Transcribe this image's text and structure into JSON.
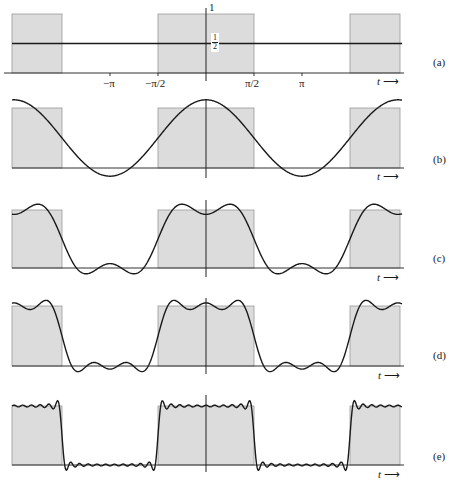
{
  "chart_data": {
    "type": "line",
    "title": "",
    "xlabel": "t",
    "ylabel": "",
    "x_ticks": [
      "−π",
      "−π/2",
      "π/2",
      "π"
    ],
    "x_tick_values": [
      -3.14159,
      -1.5708,
      1.5708,
      3.14159
    ],
    "y_ticks": [
      "1",
      "1/2"
    ],
    "y_tick_values": [
      1,
      0.5
    ],
    "xlim": [
      -5.1,
      5.1
    ],
    "square_wave": {
      "high": 1,
      "low": 0,
      "high_intervals": [
        [
          -5.1,
          -4.712
        ],
        [
          -1.5708,
          1.5708
        ],
        [
          4.712,
          5.1
        ]
      ]
    },
    "fill_color": "#dcdcdc",
    "line_color": "#1a1a1a",
    "panels": [
      {
        "label": "(a)",
        "terms": 0,
        "series": "1/2"
      },
      {
        "label": "(b)",
        "terms": 1,
        "series": "1/2 + (2/π)cos t"
      },
      {
        "label": "(c)",
        "terms": 2,
        "series": "1/2 + (2/π)(cos t − cos 3t/3)"
      },
      {
        "label": "(d)",
        "terms": 3,
        "series": "1/2 + (2/π)(cos t − cos 3t/3 + cos 5t/5)"
      },
      {
        "label": "(e)",
        "terms": 11,
        "series": "1/2 + (2/π)Σ(−1)^k cos((2k+1)t)/(2k+1), k=0..10"
      }
    ]
  },
  "axis": {
    "t_label": "t",
    "arrow": "⟶",
    "one_label": "1",
    "half_num": "1",
    "half_den": "2",
    "ticks": {
      "neg_pi": "−π",
      "neg_half_pi": "−π/2",
      "half_pi": "π/2",
      "pi": "π"
    }
  },
  "panels": [
    {
      "label": "(a)"
    },
    {
      "label": "(b)"
    },
    {
      "label": "(c)"
    },
    {
      "label": "(d)"
    },
    {
      "label": "(e)"
    }
  ]
}
